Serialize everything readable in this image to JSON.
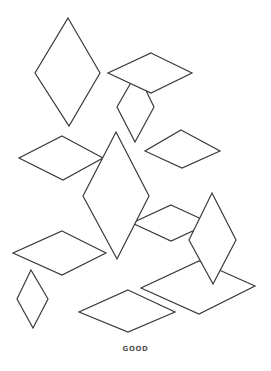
{
  "figure": {
    "caption": "GOOD",
    "stroke_color": "#3a3a3a",
    "fill_color": "#ffffff",
    "background": "#ffffff"
  },
  "shapes": [
    {
      "id": "diamond-1",
      "points": [
        [
          68,
          18
        ],
        [
          100,
          73
        ],
        [
          69,
          126
        ],
        [
          35,
          73
        ]
      ]
    },
    {
      "id": "diamond-3",
      "points": [
        [
          137,
          72
        ],
        [
          154,
          107
        ],
        [
          135,
          142
        ],
        [
          117,
          107
        ]
      ]
    },
    {
      "id": "diamond-2",
      "points": [
        [
          151,
          53
        ],
        [
          192,
          73
        ],
        [
          151,
          93
        ],
        [
          108,
          73
        ]
      ]
    },
    {
      "id": "diamond-4",
      "points": [
        [
          62,
          136
        ],
        [
          103,
          158
        ],
        [
          63,
          180
        ],
        [
          19,
          158
        ]
      ]
    },
    {
      "id": "diamond-6",
      "points": [
        [
          181,
          130
        ],
        [
          220,
          151
        ],
        [
          182,
          168
        ],
        [
          145,
          151
        ]
      ]
    },
    {
      "id": "diamond-7",
      "points": [
        [
          171,
          205
        ],
        [
          210,
          223
        ],
        [
          171,
          241
        ],
        [
          132,
          223
        ]
      ]
    },
    {
      "id": "diamond-5",
      "points": [
        [
          116,
          132
        ],
        [
          149,
          196
        ],
        [
          117,
          259
        ],
        [
          83,
          196
        ]
      ]
    },
    {
      "id": "diamond-10",
      "points": [
        [
          62,
          231
        ],
        [
          106,
          253
        ],
        [
          62,
          275
        ],
        [
          13,
          253
        ]
      ]
    },
    {
      "id": "diamond-9",
      "points": [
        [
          199,
          261
        ],
        [
          255,
          286
        ],
        [
          199,
          314
        ],
        [
          141,
          288
        ]
      ]
    },
    {
      "id": "diamond-8",
      "points": [
        [
          212,
          193
        ],
        [
          236,
          240
        ],
        [
          213,
          284
        ],
        [
          189,
          240
        ]
      ]
    },
    {
      "id": "diamond-11",
      "points": [
        [
          31,
          270
        ],
        [
          48,
          299
        ],
        [
          33,
          328
        ],
        [
          17,
          299
        ]
      ]
    },
    {
      "id": "diamond-12",
      "points": [
        [
          128,
          290
        ],
        [
          175,
          312
        ],
        [
          128,
          332
        ],
        [
          79,
          312
        ]
      ]
    }
  ]
}
